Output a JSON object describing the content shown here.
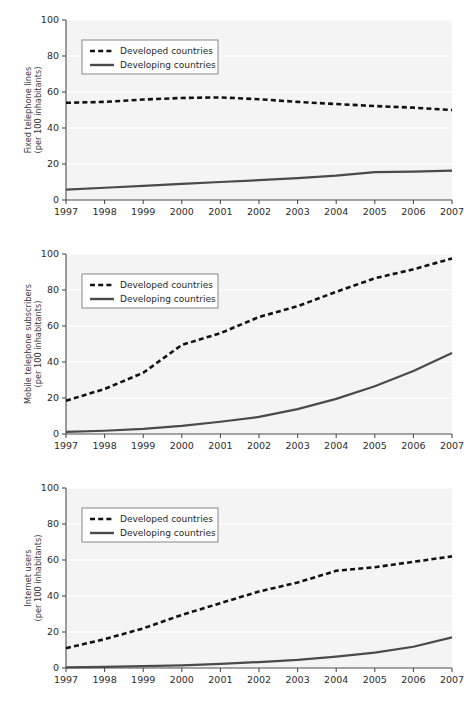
{
  "figure": {
    "panel_count": 3,
    "background_color": "#ffffff",
    "plot_background_color": "#f4f4f4",
    "grid_color": "#ffffff",
    "axis_color": "#4d4d4d",
    "series_colors": {
      "developed": "#111111",
      "developing": "#4a4a4a"
    }
  },
  "legend": {
    "developed_label": "Developed countries",
    "developing_label": "Developing countries",
    "developed_style": "dashed",
    "developing_style": "solid",
    "position": "top-left",
    "box_fill": "#ffffff",
    "box_border": "#7a7a7a"
  },
  "axis": {
    "x_ticks": [
      "1997",
      "1998",
      "1999",
      "2000",
      "2001",
      "2002",
      "2003",
      "2004",
      "2005",
      "2006",
      "2007"
    ],
    "y_ticks": [
      "0",
      "20",
      "40",
      "60",
      "80",
      "100"
    ],
    "x_label": "",
    "xlim": [
      1997,
      2007
    ],
    "ylim": [
      0,
      100
    ]
  },
  "chart_data": [
    {
      "type": "line",
      "panel_index": 1,
      "title": "",
      "ylabel": "Fixed telephone lines\n(per 100 inhabitants)",
      "ylabel_line1": "Fixed telephone lines",
      "ylabel_line2": "(per 100 inhabitants)",
      "xlabel": "",
      "x": [
        1997,
        1998,
        1999,
        2000,
        2001,
        2002,
        2003,
        2004,
        2005,
        2006,
        2007
      ],
      "xlim": [
        1997,
        2007
      ],
      "ylim": [
        0,
        100
      ],
      "grid": true,
      "legend_position": "top-left",
      "series": [
        {
          "name": "Developed countries",
          "style": "dashed",
          "values": [
            54.0,
            54.5,
            55.8,
            56.7,
            57.0,
            56.0,
            54.5,
            53.3,
            52.2,
            51.3,
            50.0
          ]
        },
        {
          "name": "Developing countries",
          "style": "solid",
          "values": [
            5.8,
            6.8,
            7.8,
            9.0,
            10.0,
            11.0,
            12.2,
            13.5,
            15.5,
            15.8,
            16.3
          ]
        }
      ]
    },
    {
      "type": "line",
      "panel_index": 2,
      "title": "",
      "ylabel": "Mobile telephone subscribers\n(per 100 inhabitants)",
      "ylabel_line1": "Mobile telephone subscribers",
      "ylabel_line2": "(per 100 inhabitants)",
      "xlabel": "",
      "x": [
        1997,
        1998,
        1999,
        2000,
        2001,
        2002,
        2003,
        2004,
        2005,
        2006,
        2007
      ],
      "xlim": [
        1997,
        2007
      ],
      "ylim": [
        0,
        100
      ],
      "grid": true,
      "legend_position": "top-left",
      "series": [
        {
          "name": "Developed countries",
          "style": "dashed",
          "values": [
            18.5,
            25.0,
            34.0,
            49.5,
            56.0,
            65.0,
            71.0,
            79.0,
            86.5,
            91.5,
            97.5
          ]
        },
        {
          "name": "Developing countries",
          "style": "solid",
          "values": [
            1.2,
            1.8,
            2.8,
            4.5,
            6.8,
            9.5,
            13.8,
            19.5,
            26.5,
            35.0,
            45.0
          ]
        }
      ]
    },
    {
      "type": "line",
      "panel_index": 3,
      "title": "",
      "ylabel": "Internet users\n(per 100 inhabitants)",
      "ylabel_line1": "Internet users",
      "ylabel_line2": "(per 100 inhabitants)",
      "xlabel": "",
      "x": [
        1997,
        1998,
        1999,
        2000,
        2001,
        2002,
        2003,
        2004,
        2005,
        2006,
        2007
      ],
      "xlim": [
        1997,
        2007
      ],
      "ylim": [
        0,
        100
      ],
      "grid": true,
      "legend_position": "top-left",
      "series": [
        {
          "name": "Developed countries",
          "style": "dashed",
          "values": [
            11.0,
            16.0,
            22.0,
            29.5,
            36.0,
            42.5,
            47.5,
            54.0,
            56.0,
            59.0,
            62.0
          ]
        },
        {
          "name": "Developing countries",
          "style": "solid",
          "values": [
            0.3,
            0.6,
            1.0,
            1.5,
            2.3,
            3.3,
            4.5,
            6.3,
            8.5,
            11.8,
            17.0
          ]
        }
      ]
    }
  ]
}
